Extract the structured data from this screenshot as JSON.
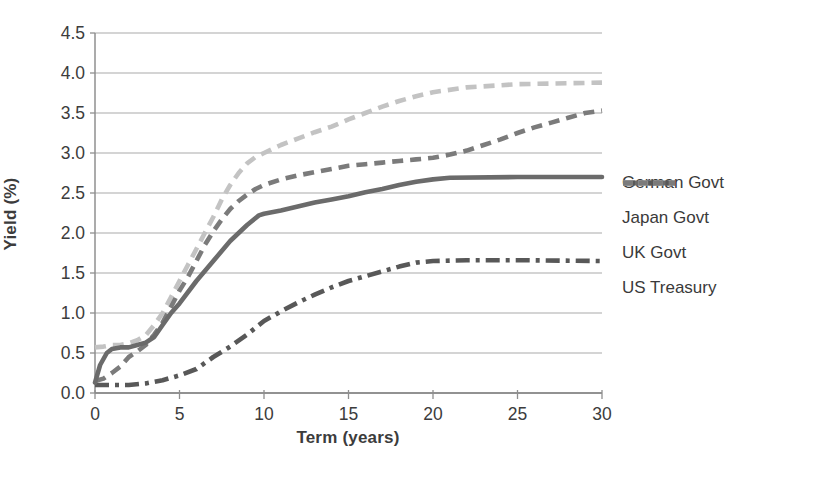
{
  "chart_data": {
    "type": "line",
    "title": "",
    "xlabel": "Term (years)",
    "ylabel": "Yield (%)",
    "xlim": [
      0,
      30
    ],
    "ylim": [
      0,
      4.5
    ],
    "x_ticks": [
      "0",
      "5",
      "10",
      "15",
      "20",
      "25",
      "30"
    ],
    "x_tick_values": [
      0,
      5,
      10,
      15,
      20,
      25,
      30
    ],
    "y_ticks": [
      "0.0",
      "0.5",
      "1.0",
      "1.5",
      "2.0",
      "2.5",
      "3.0",
      "3.5",
      "4.0",
      "4.5"
    ],
    "y_tick_values": [
      0,
      0.5,
      1.0,
      1.5,
      2.0,
      2.5,
      3.0,
      3.5,
      4.0,
      4.5
    ],
    "grid": "horizontal",
    "legend_position": "right",
    "colors": {
      "grid": "#a9a9a9",
      "axis": "#8f8f8f",
      "tick_text": "#3c3c3c",
      "background": "#ffffff"
    },
    "series": [
      {
        "name": "German Govt",
        "style": "solid",
        "color": "#6b6b6b",
        "dash": null,
        "x": [
          0,
          0.3,
          0.7,
          1,
          1.5,
          2,
          2.5,
          3,
          3.5,
          4,
          4.5,
          5,
          6,
          7,
          8,
          9,
          9.7,
          10,
          11,
          12,
          13,
          14,
          15,
          16,
          17,
          18,
          19,
          20,
          21,
          25,
          30
        ],
        "y": [
          0.13,
          0.35,
          0.5,
          0.55,
          0.57,
          0.57,
          0.6,
          0.63,
          0.7,
          0.85,
          1.0,
          1.12,
          1.4,
          1.65,
          1.9,
          2.1,
          2.22,
          2.24,
          2.28,
          2.33,
          2.38,
          2.42,
          2.46,
          2.51,
          2.55,
          2.6,
          2.64,
          2.67,
          2.69,
          2.7,
          2.7
        ]
      },
      {
        "name": "Japan Govt",
        "style": "dash-dot",
        "color": "#585858",
        "dash": [
          14,
          6,
          4,
          6
        ],
        "x": [
          0,
          0.5,
          1,
          2,
          3,
          4,
          5,
          6,
          7,
          8,
          9,
          10,
          11,
          12,
          13,
          14,
          15,
          16,
          17,
          18,
          19,
          20,
          22,
          25,
          30
        ],
        "y": [
          0.1,
          0.1,
          0.1,
          0.1,
          0.12,
          0.16,
          0.22,
          0.3,
          0.45,
          0.58,
          0.73,
          0.9,
          1.02,
          1.13,
          1.23,
          1.32,
          1.4,
          1.46,
          1.52,
          1.58,
          1.63,
          1.65,
          1.66,
          1.66,
          1.65
        ]
      },
      {
        "name": "UK Govt",
        "style": "dashed",
        "color": "#c3c3c3",
        "dash": [
          11,
          7
        ],
        "x": [
          0,
          0.5,
          1,
          1.5,
          2,
          2.5,
          3,
          3.5,
          4,
          4.5,
          5,
          5.5,
          6,
          6.5,
          7,
          7.5,
          8,
          8.5,
          9,
          9.5,
          10,
          11,
          12,
          13,
          14,
          15,
          16,
          17,
          18,
          19,
          20,
          22,
          25,
          30
        ],
        "y": [
          0.57,
          0.58,
          0.6,
          0.6,
          0.62,
          0.66,
          0.72,
          0.85,
          1.0,
          1.2,
          1.4,
          1.6,
          1.8,
          2.0,
          2.2,
          2.42,
          2.6,
          2.75,
          2.87,
          2.95,
          3.0,
          3.1,
          3.18,
          3.26,
          3.33,
          3.42,
          3.5,
          3.58,
          3.65,
          3.71,
          3.76,
          3.82,
          3.86,
          3.88
        ]
      },
      {
        "name": "US Treasury",
        "style": "dashed",
        "color": "#7b7b7b",
        "dash": [
          11,
          7
        ],
        "x": [
          0,
          0.5,
          1,
          1.5,
          2,
          2.5,
          3,
          3.5,
          4,
          4.5,
          5,
          5.5,
          6,
          6.5,
          7,
          7.5,
          8,
          8.5,
          9,
          9.5,
          10,
          11,
          12,
          13,
          14,
          15,
          16,
          17,
          18,
          19,
          20,
          21,
          22,
          23,
          24,
          25,
          26,
          27,
          28,
          29,
          30
        ],
        "y": [
          0.15,
          0.18,
          0.25,
          0.33,
          0.45,
          0.52,
          0.6,
          0.73,
          0.88,
          1.08,
          1.28,
          1.45,
          1.65,
          1.85,
          2.02,
          2.17,
          2.3,
          2.4,
          2.48,
          2.55,
          2.6,
          2.67,
          2.72,
          2.76,
          2.8,
          2.84,
          2.86,
          2.88,
          2.9,
          2.92,
          2.94,
          2.98,
          3.03,
          3.1,
          3.17,
          3.25,
          3.32,
          3.38,
          3.44,
          3.5,
          3.53
        ]
      }
    ]
  }
}
